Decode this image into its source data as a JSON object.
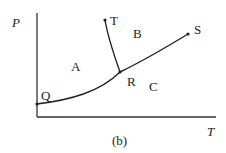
{
  "diagram": {
    "axes": {
      "y_label": "P",
      "x_label": "T"
    },
    "caption": "(b)",
    "regions": [
      "A",
      "B",
      "C"
    ],
    "points": {
      "Q": "Q",
      "R": "R",
      "S": "S",
      "T": "T"
    },
    "curves": [
      "Q-R",
      "R-S",
      "R-T"
    ],
    "line_color": "#222222"
  }
}
